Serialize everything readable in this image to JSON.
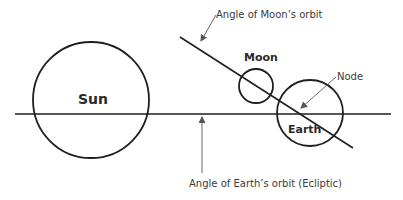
{
  "diagram": {
    "colors": {
      "stroke": "#1f1f1f",
      "arrow": "#555555",
      "text": "#2a2a2a"
    },
    "bodies": {
      "sun": {
        "label": "Sun"
      },
      "moon": {
        "label": "Moon"
      },
      "earth": {
        "label": "Earth"
      }
    },
    "annotations": {
      "moon_orbit": "Angle of Moon’s orbit",
      "node": "Node",
      "ecliptic": "Angle of Earth’s orbit (Ecliptic)"
    }
  }
}
